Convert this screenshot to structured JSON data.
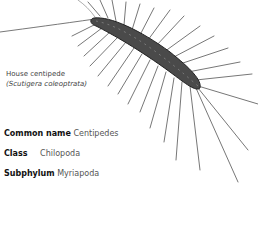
{
  "illustration": {
    "subject": "house centipede drawing",
    "icon": "centipede-illustration"
  },
  "caption": {
    "common": "House centipede",
    "scientific": "(Scutigera coleoptrata)"
  },
  "facts": [
    {
      "label": "Common name",
      "value": "Centipedes"
    },
    {
      "label": "Class",
      "value": "Chilopoda"
    },
    {
      "label": "Subphylum",
      "value": "Myriapoda"
    }
  ]
}
